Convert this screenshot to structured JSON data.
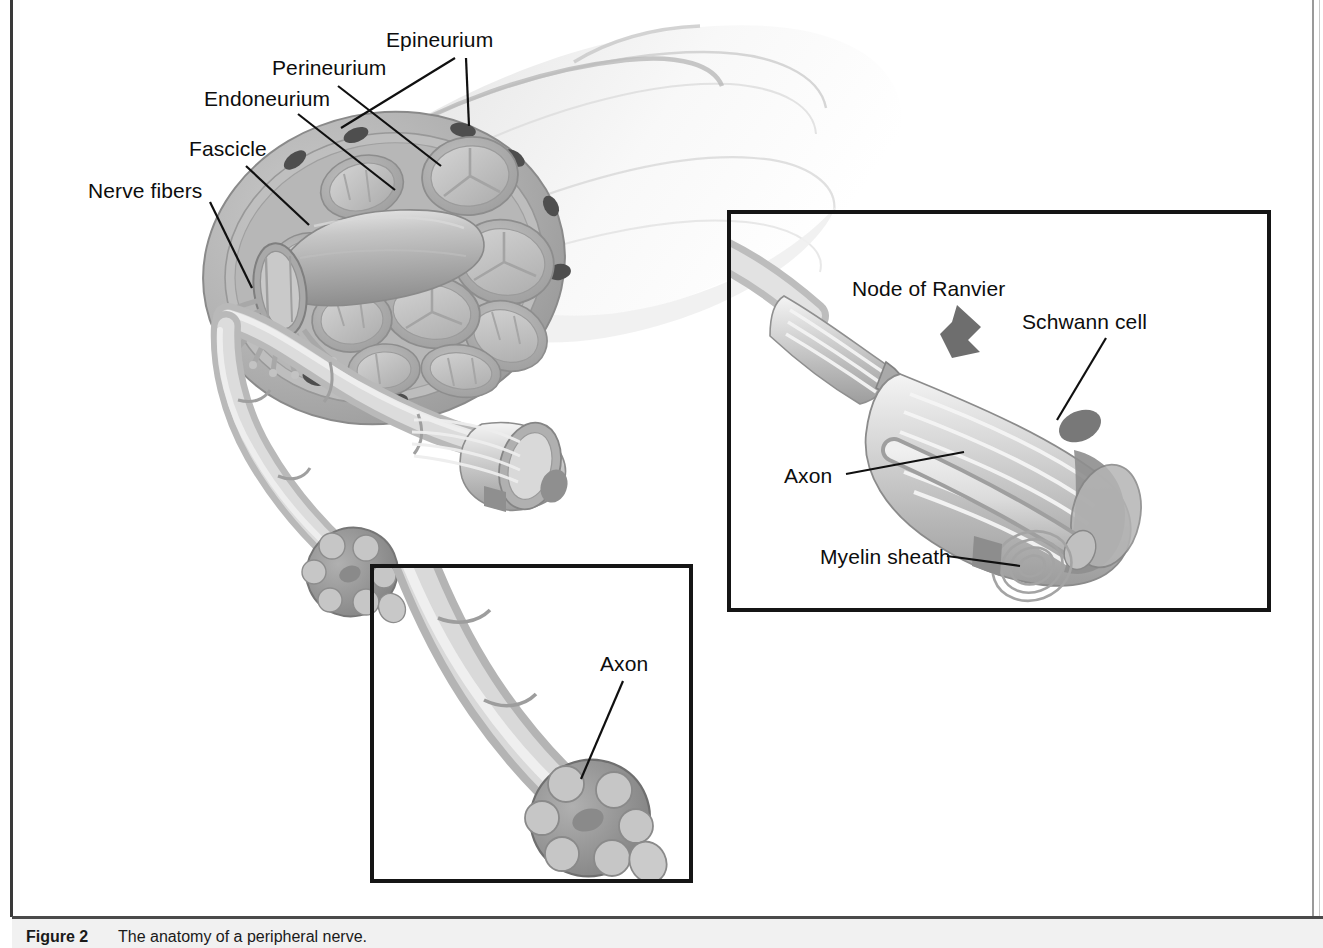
{
  "figure": {
    "caption_number": "Figure 2",
    "caption_text": "The anatomy of a peripheral nerve.",
    "title": "The anatomy of a peripheral nerve",
    "background_color": "#ffffff",
    "ink_color": "#0d0d0d"
  },
  "main_labels": {
    "epineurium": "Epineurium",
    "perineurium": "Perineurium",
    "endoneurium": "Endoneurium",
    "fascicle": "Fascicle",
    "nerve_fibers": "Nerve fibers"
  },
  "inset_right": {
    "node_of_ranvier": "Node of Ranvier",
    "schwann_cell": "Schwann cell",
    "axon": "Axon",
    "myelin_sheath": "Myelin sheath",
    "arrow_color": "#6e6e6e",
    "border_color": "#151515"
  },
  "inset_bottom": {
    "axon": "Axon",
    "border_color": "#151515"
  },
  "palette": {
    "epineurium_fill": "#b4b4b4",
    "epineurium_edge": "#8d8d8d",
    "perineurium_fill": "#a6a6a6",
    "endoneurium_fill": "#c4c4c4",
    "fascicle_fill": "#bdbdbd",
    "vessel_dark": "#4a4a4a",
    "nerve_trunk": "#e8e8e8",
    "myelin_light": "#f2f2f2",
    "axon_fill": "#cfcfcf",
    "shadow": "#9a9a9a"
  }
}
